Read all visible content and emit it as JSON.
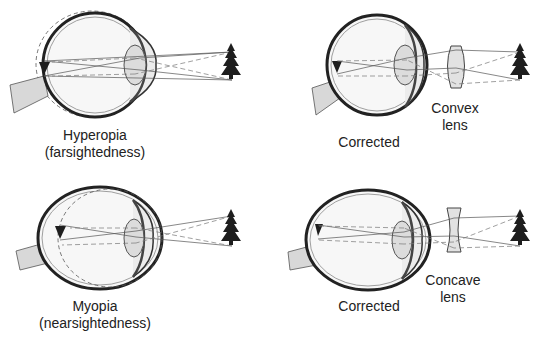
{
  "figure": {
    "background": "#ffffff",
    "ink_color": "#222222",
    "panels": [
      {
        "id": "hyperopia",
        "title_line1": "Hyperopia",
        "title_line2": "(farsightedness)",
        "eye_shape": "shortened",
        "object": "tree-icon",
        "image": "inverted-triangle-behind-retina"
      },
      {
        "id": "hyperopia-corrected",
        "title_line1": "Corrected",
        "lens_label_line1": "Convex",
        "lens_label_line2": "lens",
        "lens_type": "convex",
        "object": "tree-icon"
      },
      {
        "id": "myopia",
        "title_line1": "Myopia",
        "title_line2": "(nearsightedness)",
        "eye_shape": "elongated",
        "object": "tree-icon",
        "image": "inverted-triangle-in-front-of-retina"
      },
      {
        "id": "myopia-corrected",
        "title_line1": "Corrected",
        "lens_label_line1": "Concave",
        "lens_label_line2": "lens",
        "lens_type": "concave",
        "object": "tree-icon"
      }
    ]
  }
}
